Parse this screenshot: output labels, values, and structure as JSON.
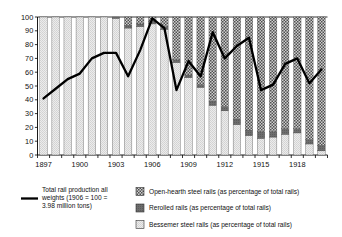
{
  "chart_data": {
    "type": "bar",
    "title": "",
    "subtitle": "",
    "xlabel": "",
    "ylabel": "",
    "ylim": [
      0,
      100
    ],
    "yticks": [
      0,
      10,
      20,
      30,
      40,
      50,
      60,
      70,
      80,
      90,
      100
    ],
    "ytick_labels": [
      "0",
      "10",
      "20",
      "30",
      "40",
      "50",
      "60",
      "70",
      "80",
      "90",
      "100"
    ],
    "xlim": [
      1896.5,
      1920.5
    ],
    "grid": false,
    "legend_position": "below",
    "stacked": true,
    "categories": [
      1897,
      1898,
      1899,
      1900,
      1901,
      1902,
      1903,
      1904,
      1905,
      1906,
      1907,
      1908,
      1909,
      1910,
      1911,
      1912,
      1913,
      1914,
      1915,
      1916,
      1917,
      1918,
      1919,
      1920
    ],
    "xtick_labels": [
      "1897",
      "1900",
      "1903",
      "1906",
      "1909",
      "1912",
      "1915",
      "1918"
    ],
    "xtick_values": [
      1897,
      1900,
      1903,
      1906,
      1909,
      1912,
      1915,
      1918
    ],
    "series": [
      {
        "name": "Bessemer steel rails (as percentage of total rails)",
        "pattern": "light-stipple",
        "values": [
          100,
          100,
          100,
          100,
          100,
          100,
          99,
          92,
          93,
          95,
          91,
          67,
          56,
          49,
          36,
          32,
          22,
          14,
          12,
          13,
          15,
          16,
          8,
          3
        ]
      },
      {
        "name": "Rerolled rails (as percentage of total rails)",
        "pattern": "dark-solid",
        "values": [
          0,
          0,
          0,
          0,
          0,
          0,
          1,
          2,
          2,
          2,
          2,
          2,
          2,
          2,
          3,
          3,
          4,
          4,
          5,
          4,
          4,
          3,
          3,
          4
        ]
      },
      {
        "name": "Open-hearth steel rails (as percentage of total rails)",
        "pattern": "checker",
        "values": [
          0,
          0,
          0,
          0,
          0,
          0,
          0,
          6,
          5,
          3,
          7,
          31,
          42,
          49,
          61,
          65,
          74,
          82,
          83,
          83,
          81,
          81,
          89,
          93
        ]
      }
    ],
    "line_series": {
      "name": "Total rail production all weights (1906 = 100 = 3.98 million tons)",
      "x": [
        1897,
        1898,
        1899,
        1900,
        1901,
        1902,
        1903,
        1904,
        1905,
        1906,
        1907,
        1908,
        1909,
        1910,
        1911,
        1912,
        1913,
        1914,
        1915,
        1916,
        1917,
        1918,
        1919,
        1920
      ],
      "values": [
        41,
        48,
        55,
        59,
        70,
        74,
        74,
        57,
        76,
        99,
        92,
        47,
        68,
        57,
        89,
        70,
        79,
        85,
        47,
        51,
        66,
        70,
        52,
        62
      ]
    }
  },
  "legend": {
    "line_entry": {
      "label_line_1": "Total rail production all",
      "label_line_2": "weights (1906 = 100 =",
      "label_line_3": "3.98 million tons)"
    },
    "items": [
      {
        "label": "Open-hearth steel rails (as percentage of total rails)",
        "swatch": "checker-swatch"
      },
      {
        "label": "Rerolled rails (as percentage of total rails)",
        "swatch": "dark-solid-swatch"
      },
      {
        "label": "Bessemer steel rails (as percentage of total rails)",
        "swatch": "light-stipple-swatch"
      }
    ]
  },
  "colors": {
    "bessemer": "#e6e6e6",
    "rerolled": "#6e6e6e",
    "open_hearth": "#a8a8a8",
    "line": "#000000",
    "axis": "#000000",
    "background": "#ffffff"
  }
}
